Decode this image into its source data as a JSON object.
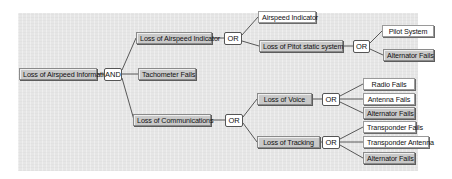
{
  "diagram": {
    "type": "fault-tree",
    "root": {
      "label": "Loss of Airspeed Information",
      "gate": "AND",
      "children": [
        "Loss of Airspeed Indicator",
        "Tachometer Fails",
        "Loss of Communications"
      ]
    },
    "nodes": {
      "root": "Loss of Airspeed Information",
      "and_gate": "AND",
      "loss_airspeed_indicator": "Loss of Airspeed Indicator",
      "tachometer_fails": "Tachometer Fails",
      "loss_communications": "Loss of Communications",
      "or_indicator": "OR",
      "airspeed_indicator": "Airspeed Indicator",
      "loss_pitot_static": "Loss of Pitot static system",
      "or_pitot": "OR",
      "pilot_system": "Pilot System",
      "alternator_fails_1": "Alternator Fails",
      "or_comm": "OR",
      "loss_voice": "Loss of Voice",
      "or_voice": "OR",
      "radio_fails": "Radio Fails",
      "antenna_fails": "Antenna Fails",
      "alternator_fails_2": "Alternator Fails",
      "loss_tracking": "Loss of Tracking",
      "or_tracking": "OR",
      "transponder_fails": "Transponder Fails",
      "transponder_antenna": "Transponder Antenna",
      "alternator_fails_3": "Alternator Fails"
    },
    "colors": {
      "panel_bg": "#e6e6e6",
      "intermediate_event_fill": "#c9c9c9",
      "basic_event_fill": "#ffffff",
      "gate_fill": "#ffffff",
      "line": "#333333"
    }
  }
}
